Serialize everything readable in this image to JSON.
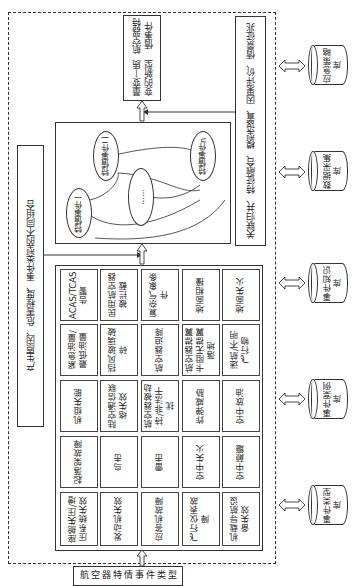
{
  "diagram": {
    "orientation": "rotated-90-ccw",
    "bottom_label": "航空器特情事件类型",
    "combination_label": "产生原因、危害程度、事件类型的不同组合",
    "result_box": {
      "line1": "量变—质变的新型",
      "line2": "航空器特情事件"
    },
    "analysis_box": {
      "line1": "关联归并、特征融合、模型设置、因果评价、",
      "line2": "情景征兆"
    },
    "ellipses": [
      {
        "id": "e1",
        "label": "特情事件一"
      },
      {
        "id": "e2",
        "label": "特情事件二"
      },
      {
        "id": "e3",
        "label": "……"
      },
      {
        "id": "en",
        "label": "特情事件n"
      }
    ],
    "event_grid": {
      "columns": [
        [
          "ACAS/TCAS告警",
          "民用航空器被拦截",
          "复杂气象条件",
          "地面相撞",
          "地面失火"
        ],
        [
          "紧急油量/最低油量",
          "挡风玻璃破碎",
          "航空器迫降",
          "航空器襟翼卡阻无襟翼落地",
          "迷航/不明飞行物"
        ],
        [
          "机组失能",
          "陆空通信联络失效",
          "航空器被劫持/非法干扰",
          "炸弹威胁",
          "空中放油"
        ],
        [
          "起落架故障",
          "鸟击",
          "雷击",
          "空中失火",
          "空中颠簸"
        ],
        [
          "座舱失压/增压系统失效",
          "发动机失效",
          "应答机故障",
          "飞行仪表故障",
          "机载导航设备失效"
        ]
      ]
    },
    "databases": [
      {
        "id": "db1",
        "label": "应急策略库"
      },
      {
        "id": "db2",
        "label": "数据采集库"
      },
      {
        "id": "db3",
        "label": "事件知识库"
      },
      {
        "id": "db4",
        "label": "事件案例库"
      },
      {
        "id": "db5",
        "label": "事件类型库"
      }
    ],
    "colors": {
      "line": "#333333",
      "background": "#ffffff"
    }
  }
}
